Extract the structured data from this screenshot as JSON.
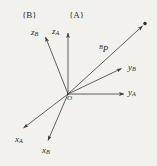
{
  "figure": {
    "background_color": "#f2f1ee",
    "ink_color": "#3a3a3a",
    "origin": {
      "label": "O",
      "x": 68,
      "y": 94
    },
    "frames": [
      {
        "id": "frame-b",
        "label_open": "{",
        "label_name": "B",
        "label_close": "}",
        "text": "{B}"
      },
      {
        "id": "frame-a",
        "label_open": "{",
        "label_name": "A",
        "label_close": "}",
        "text": "{A}"
      }
    ],
    "axes": [
      {
        "id": "z-a",
        "base": "z",
        "subscript": "A",
        "frame": "A",
        "tip_x": 68,
        "tip_y": 31,
        "has_arrowhead": true
      },
      {
        "id": "z-b",
        "base": "z",
        "subscript": "B",
        "frame": "B",
        "tip_x": 44,
        "tip_y": 35,
        "has_arrowhead": true
      },
      {
        "id": "y-a",
        "base": "y",
        "subscript": "A",
        "frame": "A",
        "tip_x": 126,
        "tip_y": 94,
        "has_arrowhead": true
      },
      {
        "id": "y-b",
        "base": "y",
        "subscript": "B",
        "frame": "B",
        "tip_x": 124,
        "tip_y": 67,
        "has_arrowhead": true
      },
      {
        "id": "x-a",
        "base": "x",
        "subscript": "A",
        "frame": "A",
        "tip_x": 21,
        "tip_y": 130,
        "has_arrowhead": true
      },
      {
        "id": "x-b",
        "base": "x",
        "subscript": "B",
        "frame": "B",
        "tip_x": 47,
        "tip_y": 143,
        "has_arrowhead": true
      }
    ],
    "vector": {
      "id": "bp",
      "superscript": "B",
      "base": "P",
      "tip_x": 145,
      "tip_y": 24,
      "has_arrowhead": true,
      "point_marker": true
    }
  }
}
